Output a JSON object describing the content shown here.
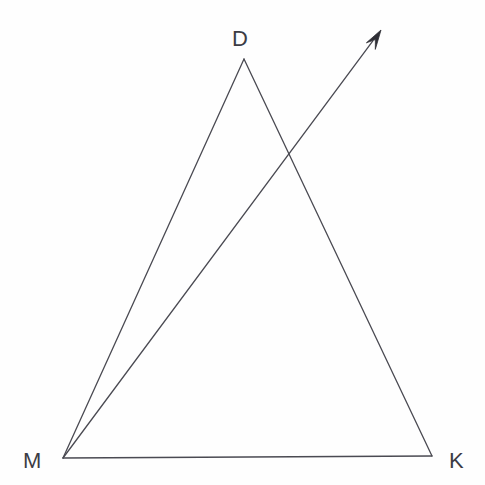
{
  "figure": {
    "background_color": "#fefefe",
    "stroke_color": "#4a4a52",
    "label_color": "#3c3c44",
    "stroke_width": 1.3,
    "width": 485,
    "height": 485
  },
  "labels": {
    "apex": "D",
    "left_base": "M",
    "right_base": "K"
  },
  "points": {
    "D": {
      "x": 244,
      "y": 59
    },
    "M": {
      "x": 63,
      "y": 458
    },
    "K": {
      "x": 432,
      "y": 456
    },
    "arrow_tip": {
      "x": 381,
      "y": 30
    },
    "ray_dk_intersection": {
      "x": 287,
      "y": 152
    }
  },
  "segments": [
    {
      "name": "side-MD",
      "from": "M",
      "to": "D"
    },
    {
      "name": "side-DK",
      "from": "D",
      "to": "K"
    },
    {
      "name": "side-MK",
      "from": "M",
      "to": "K"
    }
  ],
  "ray": {
    "name": "ray-from-M",
    "from": "M",
    "to": "arrow_tip",
    "has_arrowhead": true,
    "arrowhead_length": 19,
    "arrowhead_half_width": 7
  },
  "geometry_paths": {
    "triangle": "M 244 59 L 63 458 L 432 456 Z",
    "ray_shaft": "M 63 458 L 367 48",
    "arrowhead": "M 381 30 L 359 43 L 365 46 L 360 56 Z"
  }
}
